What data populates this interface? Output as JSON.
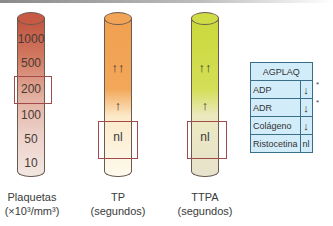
{
  "tubes": [
    {
      "id": "plaquetas",
      "label_line1": "Plaquetas",
      "label_line2": "(×10³/mm³)",
      "color_top": "#c0523e",
      "color_bottom": "#f3e6e1",
      "scale": [
        "1000",
        "500",
        "200",
        "100",
        "50",
        "10"
      ],
      "highlighted": "200"
    },
    {
      "id": "tp",
      "label_line1": "TP",
      "label_line2": "(segundos)",
      "color_top": "#f0a050",
      "color_bottom": "#fefaee",
      "markers": {
        "high": "↑↑",
        "mid": "↑",
        "normal": "nl"
      },
      "highlighted": "nl"
    },
    {
      "id": "ttpa",
      "label_line1": "TTPA",
      "label_line2": "(segundos)",
      "color_top": "#cbd93a",
      "color_bottom": "#e7e2cc",
      "markers": {
        "high": "↑↑",
        "mid": "↑",
        "normal": "nl"
      },
      "highlighted": "nl"
    }
  ],
  "agplaq": {
    "title": "AGPLAQ",
    "rows": [
      {
        "agonist": "ADP",
        "value": "↓",
        "note": "*"
      },
      {
        "agonist": "ADR",
        "value": "↓",
        "note": "*"
      },
      {
        "agonist": "Colágeno",
        "value": "↓",
        "note": ""
      },
      {
        "agonist": "Ristocetina",
        "value": "nl",
        "note": ""
      }
    ],
    "bg_color": "#d2ecf9",
    "border_color": "#3a6f8a"
  },
  "box_color": "#a14a4a"
}
